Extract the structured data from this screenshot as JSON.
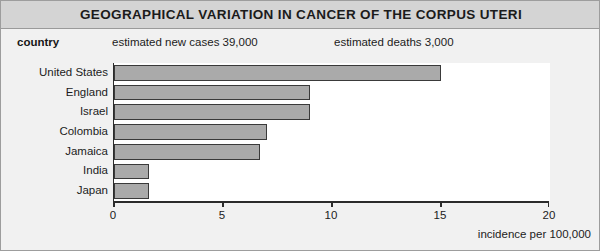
{
  "figure": {
    "title": "GEOGRAPHICAL VARIATION IN CANCER OF THE CORPUS UTERI",
    "header": {
      "country_label": "country",
      "new_cases_label": "estimated new cases 39,000",
      "deaths_label": "estimated deaths 3,000"
    },
    "colors": {
      "title_band": "#d4d4d4",
      "body_background": "#f1f1f1",
      "plot_background": "#ffffff",
      "bar_fill": "#aaaaaa",
      "bar_border": "#3a3a3a",
      "axis": "#2b2b2b",
      "text": "#1c1c1c"
    }
  },
  "chart_data": {
    "type": "bar",
    "orientation": "horizontal",
    "categories": [
      "United States",
      "England",
      "Israel",
      "Colombia",
      "Jamaica",
      "India",
      "Japan"
    ],
    "values": [
      15.0,
      9.0,
      9.0,
      7.0,
      6.7,
      1.6,
      1.6
    ],
    "xlabel": "incidence per 100,000",
    "ylabel": "country",
    "xlim": [
      0,
      20
    ],
    "xticks": [
      0,
      5,
      10,
      15,
      20
    ],
    "xtick_labels": [
      "0",
      "5",
      "10",
      "15",
      "20"
    ],
    "grid": false,
    "legend": false,
    "annotations": [
      "estimated new cases 39,000",
      "estimated deaths 3,000"
    ]
  }
}
